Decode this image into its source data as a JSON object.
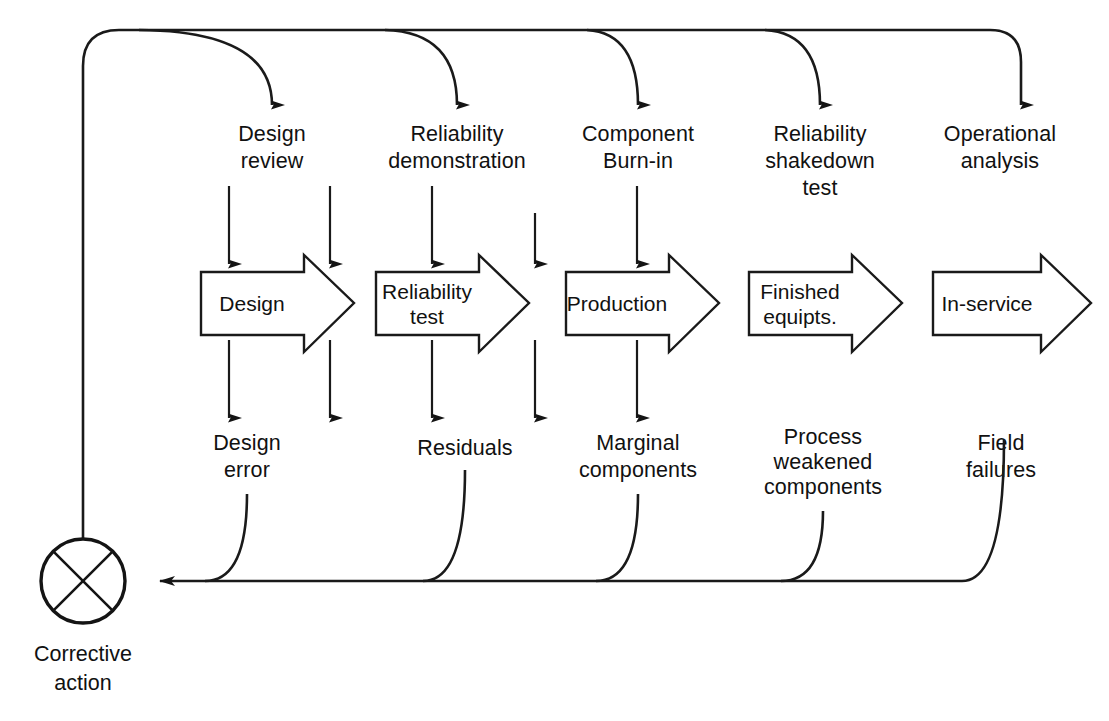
{
  "diagram": {
    "stroke_color": "#1a1a1a",
    "background_color": "#ffffff"
  },
  "feedback_node": {
    "symbol": "circle-with-cross",
    "label_line1": "Corrective",
    "label_line2": "action"
  },
  "columns": [
    {
      "id": "design",
      "top_label_line1": "Design",
      "top_label_line2": "review",
      "top_label_line3": "",
      "stage_label_line1": "Design",
      "stage_label_line2": "",
      "bottom_label_line1": "Design",
      "bottom_label_line2": "error",
      "bottom_label_line3": ""
    },
    {
      "id": "reliability-test",
      "top_label_line1": "Reliability",
      "top_label_line2": "demonstration",
      "top_label_line3": "",
      "stage_label_line1": "Reliability",
      "stage_label_line2": "test",
      "bottom_label_line1": "Residuals",
      "bottom_label_line2": "",
      "bottom_label_line3": ""
    },
    {
      "id": "production",
      "top_label_line1": "Component",
      "top_label_line2": "Burn-in",
      "top_label_line3": "",
      "stage_label_line1": "Production",
      "stage_label_line2": "",
      "bottom_label_line1": "Marginal",
      "bottom_label_line2": "components",
      "bottom_label_line3": ""
    },
    {
      "id": "finished-equipts",
      "top_label_line1": "Reliability",
      "top_label_line2": "shakedown",
      "top_label_line3": "test",
      "stage_label_line1": "Finished",
      "stage_label_line2": "equipts.",
      "bottom_label_line1": "Process",
      "bottom_label_line2": "weakened",
      "bottom_label_line3": "components"
    },
    {
      "id": "in-service",
      "top_label_line1": "Operational",
      "top_label_line2": "analysis",
      "top_label_line3": "",
      "stage_label_line1": "In-service",
      "stage_label_line2": "",
      "bottom_label_line1": "Field",
      "bottom_label_line2": "failures",
      "bottom_label_line3": ""
    }
  ]
}
